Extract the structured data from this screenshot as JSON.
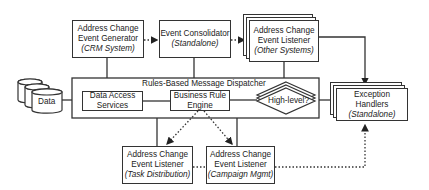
{
  "diagram": {
    "nodes": {
      "generator": {
        "line1": "Address Change",
        "line2": "Event Generator",
        "sub": "(CRM System)"
      },
      "consolidator": {
        "line1": "Event Consolidator",
        "sub": "(Standalone)"
      },
      "listener_other": {
        "line1": "Address Change",
        "line2": "Event Listener",
        "sub": "(Other Systems)"
      },
      "dispatcher": {
        "label": "Rules-Based Message Dispatcher"
      },
      "data_access": {
        "line1": "Data Access",
        "line2": "Services"
      },
      "rule_engine": {
        "line1": "Business Rule",
        "line2": "Engine"
      },
      "decision": {
        "label": "High-level?"
      },
      "data_store": {
        "label": "Data"
      },
      "exception": {
        "line1": "Exception Handlers",
        "sub": "(Standalone)"
      },
      "listener_task": {
        "line1": "Address Change",
        "line2": "Event Listener",
        "sub": "(Task Distribution)"
      },
      "listener_campaign": {
        "line1": "Address Change",
        "line2": "Event Listener",
        "sub": "(Campaign Mgmt)"
      }
    },
    "edges": [
      {
        "from": "generator",
        "to": "consolidator",
        "style": "dotted-arrow"
      },
      {
        "from": "consolidator",
        "to": "listener_other",
        "style": "dotted-arrow"
      },
      {
        "from": "generator",
        "to": "dispatcher",
        "style": "solid"
      },
      {
        "from": "consolidator",
        "to": "dispatcher",
        "style": "solid"
      },
      {
        "from": "listener_other",
        "to": "dispatcher",
        "style": "solid"
      },
      {
        "from": "listener_other",
        "to": "exception",
        "style": "solid-arrow"
      },
      {
        "from": "data_store",
        "to": "dispatcher",
        "style": "solid"
      },
      {
        "from": "data_access",
        "to": "rule_engine",
        "style": "solid"
      },
      {
        "from": "rule_engine",
        "to": "decision",
        "style": "solid"
      },
      {
        "from": "decision",
        "to": "exception",
        "style": "solid"
      },
      {
        "from": "dispatcher",
        "to": "listener_task",
        "style": "solid"
      },
      {
        "from": "dispatcher",
        "to": "listener_campaign",
        "style": "solid"
      },
      {
        "from": "rule_engine",
        "to": "listener_task",
        "style": "dotted-arrow"
      },
      {
        "from": "rule_engine",
        "to": "listener_campaign",
        "style": "dotted-arrow"
      },
      {
        "from": "listener_task",
        "to": "listener_campaign",
        "style": "dotted"
      },
      {
        "from": "listener_campaign",
        "to": "exception",
        "style": "dotted-arrow"
      }
    ]
  }
}
